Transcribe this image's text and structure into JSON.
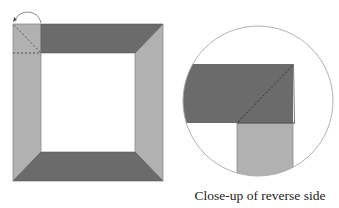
{
  "diagram": {
    "caption": "Close-up of reverse side",
    "colors": {
      "dark_band": "#6b6b6b",
      "light_band": "#b1b1b1",
      "outline": "#8a8a8a",
      "dashed_line": "#444444",
      "circle_outline": "#a8a8a8",
      "background": "#ffffff"
    },
    "elements": [
      {
        "name": "frame-top-band",
        "shade": "dark"
      },
      {
        "name": "frame-bottom-band",
        "shade": "dark"
      },
      {
        "name": "frame-left-band",
        "shade": "light"
      },
      {
        "name": "frame-right-band",
        "shade": "light"
      },
      {
        "name": "fold-arrow",
        "description": "curved arrow indicating fold at top-left corner"
      },
      {
        "name": "fold-dashed-lines",
        "description": "dashed diagonal and horizontal fold guides"
      },
      {
        "name": "closeup-circle",
        "description": "magnified view of corner from reverse side"
      }
    ]
  }
}
